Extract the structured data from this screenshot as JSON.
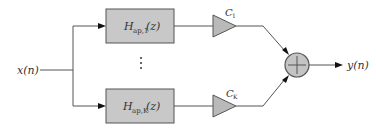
{
  "diagram": {
    "type": "parallel all-pass filter bank with gains and summation",
    "input": {
      "label": "x(n)"
    },
    "output": {
      "label": "y(n)"
    },
    "branches": [
      {
        "filter": {
          "symbol": "H",
          "subscript": "ap,1",
          "arg": "(z)"
        },
        "gain": {
          "symbol": "C",
          "subscript": "1"
        }
      },
      {
        "filter": {
          "symbol": "H",
          "subscript": "ap,K",
          "arg": "(z)"
        },
        "gain": {
          "symbol": "C",
          "subscript": "K"
        }
      }
    ],
    "ellipsis": "⋮",
    "summer": {
      "symbol": "+"
    },
    "colors": {
      "block_fill": "#c8c8c8",
      "gain_fill": "#b9b9b9",
      "summer_fill": "#c4c4c4",
      "line": "#555555",
      "text": "#333333"
    }
  }
}
